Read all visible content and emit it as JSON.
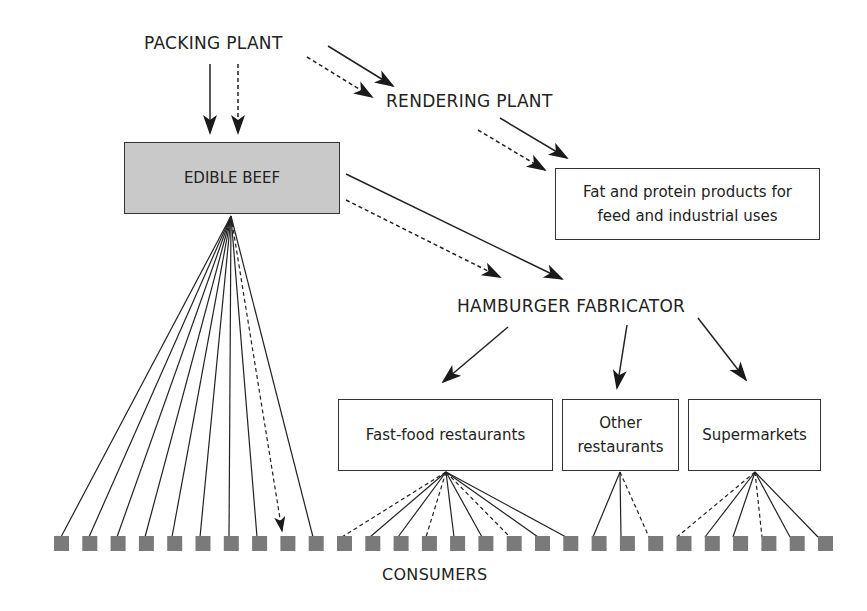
{
  "diagram": {
    "title_nodes": {
      "packing_plant": "PACKING PLANT",
      "rendering_plant": "RENDERING PLANT",
      "hamburger_fabricator": "HAMBURGER FABRICATOR",
      "consumers": "CONSUMERS"
    },
    "boxes": {
      "edible_beef": "EDIBLE BEEF",
      "fat_protein": {
        "line1": "Fat and protein products for",
        "line2": "feed and industrial uses"
      },
      "fast_food": "Fast-food restaurants",
      "other_restaurants": {
        "line1": "Other",
        "line2": "restaurants"
      },
      "supermarkets": "Supermarkets"
    },
    "colors": {
      "line": "#222222",
      "consumer_square": "#7a7a7a",
      "edible_beef_fill": "#c9c9c9"
    },
    "consumer_count": 28,
    "edges": [
      {
        "from": "PACKING PLANT",
        "to": "EDIBLE BEEF",
        "style": "solid"
      },
      {
        "from": "PACKING PLANT",
        "to": "EDIBLE BEEF",
        "style": "dashed"
      },
      {
        "from": "PACKING PLANT",
        "to": "RENDERING PLANT",
        "style": "solid"
      },
      {
        "from": "PACKING PLANT",
        "to": "RENDERING PLANT",
        "style": "dashed"
      },
      {
        "from": "RENDERING PLANT",
        "to": "Fat and protein products",
        "style": "solid"
      },
      {
        "from": "RENDERING PLANT",
        "to": "Fat and protein products",
        "style": "dashed"
      },
      {
        "from": "EDIBLE BEEF",
        "to": "HAMBURGER FABRICATOR",
        "style": "solid"
      },
      {
        "from": "EDIBLE BEEF",
        "to": "HAMBURGER FABRICATOR",
        "style": "dashed"
      },
      {
        "from": "HAMBURGER FABRICATOR",
        "to": "Fast-food restaurants",
        "style": "solid"
      },
      {
        "from": "HAMBURGER FABRICATOR",
        "to": "Other restaurants",
        "style": "solid"
      },
      {
        "from": "HAMBURGER FABRICATOR",
        "to": "Supermarkets",
        "style": "solid"
      },
      {
        "from": "EDIBLE BEEF",
        "to": "CONSUMERS 1-10",
        "style": "fan",
        "dashed_index": 8
      },
      {
        "from": "Fast-food restaurants",
        "to": "CONSUMERS 11-19",
        "style": "fan",
        "dashed_indices": [
          0,
          3,
          6
        ]
      },
      {
        "from": "Other restaurants",
        "to": "CONSUMERS 20-22",
        "style": "fan",
        "dashed_indices": [
          2
        ]
      },
      {
        "from": "Supermarkets",
        "to": "CONSUMERS 23-28",
        "style": "fan",
        "dashed_indices": [
          0,
          3
        ]
      }
    ]
  }
}
